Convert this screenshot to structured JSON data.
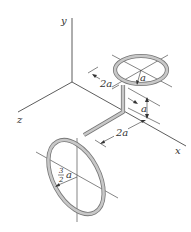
{
  "diagram": {
    "axes": {
      "x_label": "x",
      "y_label": "y",
      "z_label": "z"
    },
    "dimensions": {
      "top_ring_radius": "a",
      "offset_along_z": "2a",
      "vertical_height": "a",
      "offset_along_x": "2a",
      "bottom_ring_radius_num": "3",
      "bottom_ring_radius_den": "2",
      "bottom_ring_radius_var": "a"
    },
    "colors": {
      "rod": "#c8c8c8",
      "rod_edge": "#777777",
      "lines": "#333333"
    }
  }
}
